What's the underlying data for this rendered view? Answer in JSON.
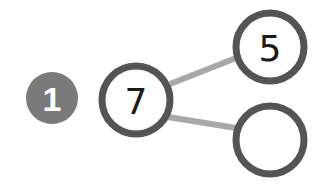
{
  "problem": {
    "number": "1",
    "badge_color": "#7a7a7a"
  },
  "number_bond": {
    "whole": "7",
    "parts": [
      "5",
      ""
    ],
    "circle_stroke_color": "#545454",
    "line_color": "#a8a8a8"
  }
}
